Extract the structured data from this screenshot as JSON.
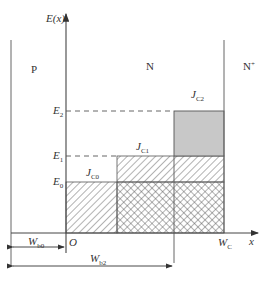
{
  "diagram": {
    "y_axis_label": "E(x)",
    "x_axis_label": "x",
    "origin_label": "O",
    "regions": [
      {
        "name": "P",
        "label": "P"
      },
      {
        "name": "N",
        "label": "N"
      },
      {
        "name": "N+",
        "label": "N",
        "sup": "+"
      }
    ],
    "energy_levels": [
      {
        "name": "E2",
        "base": "E",
        "sub": "2"
      },
      {
        "name": "E1",
        "base": "E",
        "sub": "1"
      },
      {
        "name": "E0",
        "base": "E",
        "sub": "0"
      }
    ],
    "current_labels": [
      {
        "name": "JC0",
        "base": "J",
        "sub": "C0"
      },
      {
        "name": "JC1",
        "base": "J",
        "sub": "C1"
      },
      {
        "name": "JC2",
        "base": "J",
        "sub": "C2"
      }
    ],
    "widths": [
      {
        "name": "Wb0",
        "base": "W",
        "sub": "b0"
      },
      {
        "name": "Wb2",
        "base": "W",
        "sub": "b2"
      },
      {
        "name": "WC",
        "base": "W",
        "sub": "C"
      }
    ],
    "colors": {
      "line": "#555555",
      "gray_fill": "#c8c8c8",
      "hatch": "#555555"
    }
  }
}
